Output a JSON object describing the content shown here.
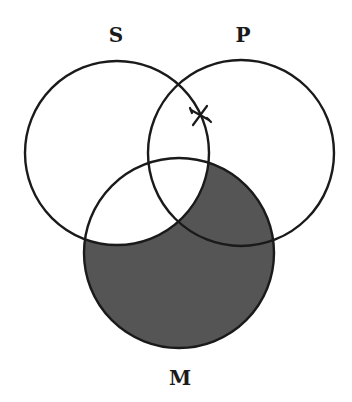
{
  "diagram": {
    "type": "venn-three-circle",
    "labels": {
      "S": "S",
      "P": "P",
      "M": "M"
    },
    "circles": {
      "S": {
        "cx": 117,
        "cy": 153,
        "r": 92
      },
      "P": {
        "cx": 241,
        "cy": 153,
        "r": 93
      },
      "M": {
        "cx": 179,
        "cy": 253,
        "r": 95
      }
    },
    "shaded_regions": [
      "M only",
      "P∩M not S"
    ],
    "marks": [
      {
        "symbol": "X",
        "position": "on S boundary within P, outside M"
      }
    ],
    "colors": {
      "stroke": "#1a1a1a",
      "shade": "#555555",
      "background": "#ffffff"
    }
  }
}
